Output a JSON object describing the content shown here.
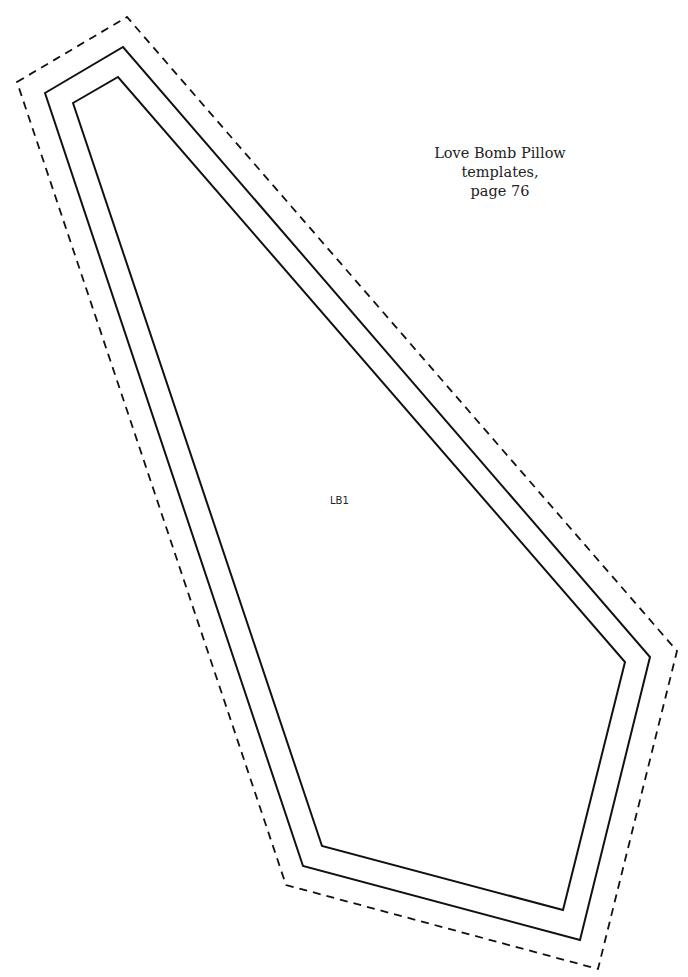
{
  "caption": {
    "line1": "Love Bomb Pillow templates,",
    "line2": "page 76"
  },
  "piece": {
    "label": "LB1"
  },
  "shapes": {
    "cut_line": "dashed",
    "seam_line": "solid outer",
    "finish_line": "solid inner"
  }
}
